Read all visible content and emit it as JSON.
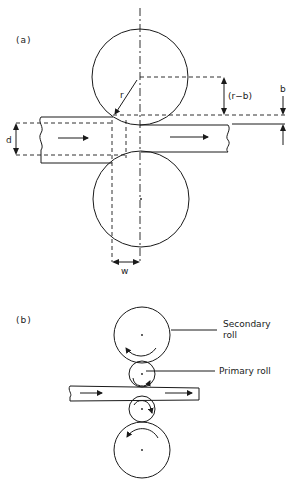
{
  "figure": {
    "panel_a": {
      "label": "(a)",
      "dimensions": {
        "radius": "r",
        "offset": "(r−b)",
        "draft": "b",
        "thickness": "d",
        "contact_width": "w"
      }
    },
    "panel_b": {
      "label": "(b)",
      "callouts": {
        "secondary_line1": "Secondary",
        "secondary_line2": "roll",
        "primary": "Primary roll"
      }
    },
    "colors": {
      "ink": "#1a1a1a",
      "background": "#ffffff"
    }
  }
}
